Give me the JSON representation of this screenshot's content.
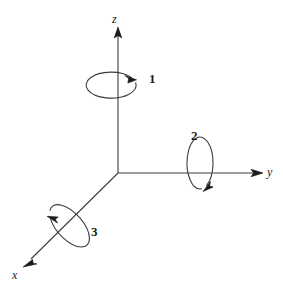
{
  "figure": {
    "background_color": "#ffffff",
    "stroke_color": "#3c3c3c",
    "text_color": "#1a1a1a",
    "width": 283,
    "height": 291
  },
  "axes": [
    {
      "id": "z",
      "label": "z",
      "label_x": 112,
      "label_y": 13,
      "direction": "up",
      "origin": {
        "x": 118,
        "y": 173
      },
      "tip": {
        "x": 118,
        "y": 28
      }
    },
    {
      "id": "y",
      "label": "y",
      "label_x": 267,
      "label_y": 166,
      "direction": "right",
      "origin": {
        "x": 118,
        "y": 173
      },
      "tip": {
        "x": 262,
        "y": 173
      }
    },
    {
      "id": "x",
      "label": "x",
      "label_x": 12,
      "label_y": 269,
      "direction": "down-left",
      "origin": {
        "x": 118,
        "y": 173
      },
      "tip": {
        "x": 24,
        "y": 266
      }
    }
  ],
  "rotations": [
    {
      "id": "rotation-1",
      "label": "1",
      "label_x": 149,
      "label_y": 72,
      "about_axis": "z",
      "center": {
        "x": 115,
        "y": 85
      },
      "rx": 25,
      "ry": 13,
      "tilt_deg": 0,
      "arrow_at": {
        "x": 131,
        "y": 76
      },
      "arrow_angle_deg": 45
    },
    {
      "id": "rotation-2",
      "label": "2",
      "label_x": 191,
      "label_y": 129,
      "about_axis": "y",
      "center": {
        "x": 198,
        "y": 174
      },
      "rx": 13,
      "ry": 26,
      "tilt_deg": 0,
      "arrow_at": {
        "x": 208,
        "y": 187
      },
      "arrow_angle_deg": 118
    },
    {
      "id": "rotation-3",
      "label": "3",
      "label_x": 91,
      "label_y": 225,
      "about_axis": "x",
      "center": {
        "x": 68,
        "y": 219
      },
      "rx": 13,
      "ry": 26,
      "tilt_deg": -42,
      "arrow_at": {
        "x": 55,
        "y": 216
      },
      "arrow_angle_deg": 100
    }
  ]
}
